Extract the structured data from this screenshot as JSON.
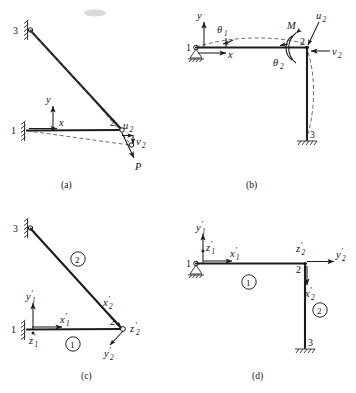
{
  "figure": {
    "type": "structural-engineering-diagram",
    "width": 356,
    "height": 393,
    "background_color": "#ffffff",
    "line_color": "#1c1c1c",
    "dashed_color": "#555555"
  },
  "panels": [
    {
      "id": "a",
      "caption": "(a)",
      "caption_x": 68,
      "caption_y": 186,
      "nodes": [
        {
          "label": "1",
          "x": 22,
          "y": 131,
          "support": "vertical-hatch-wall"
        },
        {
          "label": "2",
          "x": 120,
          "y": 130,
          "support": "none"
        },
        {
          "label": "3",
          "x": 28,
          "y": 30,
          "support": "vertical-hatch-wall"
        }
      ],
      "global_axes": [
        {
          "label": "y",
          "direction": "up"
        },
        {
          "label": "x",
          "direction": "right"
        }
      ],
      "displacements": [
        {
          "label": "u",
          "sub": "2",
          "direction": "right",
          "at_node": "2"
        },
        {
          "label": "v",
          "sub": "2",
          "direction": "down",
          "at_node": "2"
        }
      ],
      "loads": [
        {
          "label": "P",
          "direction": "down-right",
          "at_node": "2"
        }
      ],
      "deformed_shape": "dashed"
    },
    {
      "id": "b",
      "caption": "(b)",
      "caption_x": 252,
      "caption_y": 186,
      "nodes": [
        {
          "label": "1",
          "x": 196,
          "y": 48,
          "support": "pin-triangle-ground"
        },
        {
          "label": "2",
          "x": 307,
          "y": 47,
          "support": "none"
        },
        {
          "label": "3",
          "x": 307,
          "y": 140,
          "support": "ground-hatch"
        }
      ],
      "global_axes": [
        {
          "label": "y",
          "direction": "up"
        },
        {
          "label": "x",
          "direction": "right"
        }
      ],
      "rotations": [
        {
          "label": "θ",
          "sub": "1",
          "at_node": "1"
        },
        {
          "label": "θ",
          "sub": "2",
          "at_node": "2"
        }
      ],
      "displacements": [
        {
          "label": "u",
          "sub": "2",
          "direction": "up-right",
          "at_node": "2"
        },
        {
          "label": "v",
          "sub": "2",
          "direction": "left",
          "at_node": "2"
        }
      ],
      "moments": [
        {
          "label": "M",
          "sense": "curved-arrow",
          "at_node": "2"
        }
      ],
      "deformed_shape": "dashed"
    },
    {
      "id": "c",
      "caption": "(c)",
      "caption_x": 88,
      "caption_y": 377,
      "nodes": [
        {
          "label": "1",
          "x": 22,
          "y": 330,
          "support": "vertical-hatch-wall"
        },
        {
          "label": "2",
          "x": 120,
          "y": 329,
          "support": "none"
        },
        {
          "label": "3",
          "x": 28,
          "y": 228,
          "support": "vertical-hatch-wall"
        }
      ],
      "elements": [
        {
          "number": "1",
          "x": 73,
          "y": 344
        },
        {
          "number": "2",
          "x": 78,
          "y": 259
        }
      ],
      "local_axes": [
        {
          "label": "y",
          "sub": "1",
          "prime": true,
          "direction": "up",
          "member": "1"
        },
        {
          "label": "x",
          "sub": "1",
          "prime": true,
          "direction": "right",
          "member": "1"
        },
        {
          "label": "z",
          "sub": "1",
          "prime": true,
          "direction": "out-of-plane",
          "member": "1"
        },
        {
          "label": "x",
          "sub": "2",
          "prime": true,
          "direction": "up-left-along-member",
          "member": "2"
        },
        {
          "label": "z",
          "sub": "2",
          "prime": true,
          "direction": "out-of-plane",
          "member": "2"
        },
        {
          "label": "y",
          "sub": "2",
          "prime": true,
          "direction": "down-left",
          "member": "2"
        }
      ]
    },
    {
      "id": "d",
      "caption": "(d)",
      "caption_x": 258,
      "caption_y": 377,
      "nodes": [
        {
          "label": "1",
          "x": 196,
          "y": 264,
          "support": "pin-triangle-ground"
        },
        {
          "label": "2",
          "x": 305,
          "y": 264,
          "support": "none"
        },
        {
          "label": "3",
          "x": 305,
          "y": 348,
          "support": "ground-hatch"
        }
      ],
      "elements": [
        {
          "number": "1",
          "x": 249,
          "y": 282
        },
        {
          "number": "2",
          "x": 318,
          "y": 310
        }
      ],
      "local_axes": [
        {
          "label": "y",
          "sub": "1",
          "prime": true,
          "direction": "up",
          "member": "1"
        },
        {
          "label": "z",
          "sub": "1",
          "prime": true,
          "direction": "out-of-plane",
          "member": "1"
        },
        {
          "label": "x",
          "sub": "1",
          "prime": true,
          "direction": "right",
          "member": "1"
        },
        {
          "label": "z",
          "sub": "2",
          "prime": true,
          "direction": "out-of-plane",
          "member": "2"
        },
        {
          "label": "y",
          "sub": "2",
          "prime": true,
          "direction": "right",
          "member": "2"
        },
        {
          "label": "x",
          "sub": "2",
          "prime": true,
          "direction": "down",
          "member": "2"
        }
      ]
    }
  ],
  "labels": {
    "node_1": "1",
    "node_2": "2",
    "node_3": "3",
    "axis_x": "x",
    "axis_y": "y",
    "axis_z": "z",
    "u": "u",
    "v": "v",
    "theta": "θ",
    "moment": "M",
    "load": "P",
    "sub_1": "1",
    "sub_2": "2",
    "prime": "′",
    "element_1": "1",
    "element_2": "2",
    "caption_a": "(a)",
    "caption_b": "(b)",
    "caption_c": "(c)",
    "caption_d": "(d)"
  }
}
